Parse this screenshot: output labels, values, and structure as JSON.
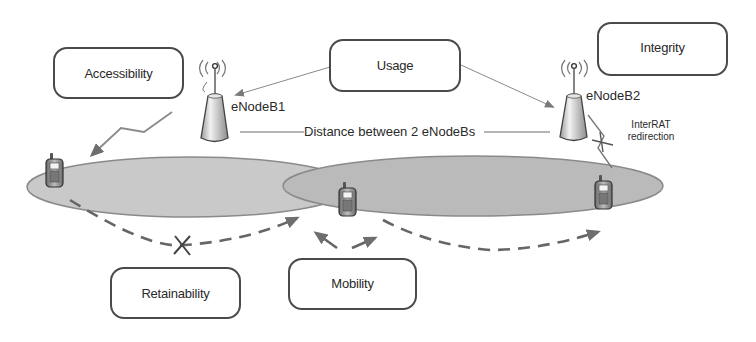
{
  "diagram": {
    "kpi_boxes": {
      "accessibility": "Accessibility",
      "usage": "Usage",
      "integrity": "Integrity",
      "retainability": "Retainability",
      "mobility": "Mobility"
    },
    "base_stations": {
      "enodeb1": "eNodeB1",
      "enodeb2": "eNodeB2"
    },
    "distance_label": "Distance between 2 eNodeBs",
    "interrat_label_line1": "InterRAT",
    "interrat_label_line2": "redirection",
    "colors": {
      "cell_fill_left": "#c8c8c8",
      "cell_fill_right": "#b9b9b9",
      "cell_stroke": "#8a8a8a",
      "arrow": "#808080",
      "box_border": "#4a4a4a",
      "text": "#2a2a2a"
    }
  }
}
